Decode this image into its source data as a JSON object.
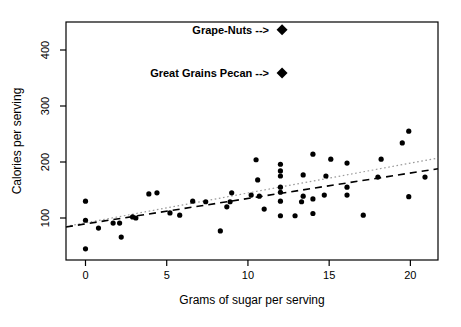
{
  "figure": {
    "background": "#ffffff",
    "frame_color": "#000000"
  },
  "chart_data": {
    "type": "scatter",
    "title": "",
    "xlabel": "Grams of sugar per serving",
    "ylabel": "Calories per serving",
    "xlim": [
      -1.2,
      21.7
    ],
    "ylim": [
      25,
      450
    ],
    "x_ticks": [
      0,
      5,
      10,
      15,
      20
    ],
    "y_ticks": [
      100,
      200,
      300,
      400
    ],
    "grid": false,
    "legend": "none",
    "point_color": "#000000",
    "points": [
      [
        0,
        130
      ],
      [
        0,
        96
      ],
      [
        0,
        45
      ],
      [
        0.8,
        82
      ],
      [
        1.7,
        91
      ],
      [
        2.1,
        91
      ],
      [
        2.2,
        66
      ],
      [
        2.9,
        102
      ],
      [
        3.1,
        100
      ],
      [
        3.9,
        143
      ],
      [
        4.4,
        145
      ],
      [
        5.2,
        109
      ],
      [
        5.8,
        105
      ],
      [
        6.6,
        130
      ],
      [
        7.4,
        129
      ],
      [
        8.3,
        77
      ],
      [
        8.7,
        120
      ],
      [
        8.9,
        129
      ],
      [
        9,
        145
      ],
      [
        10.2,
        141
      ],
      [
        10.5,
        204
      ],
      [
        10.6,
        168
      ],
      [
        10.7,
        139
      ],
      [
        11,
        116
      ],
      [
        12,
        196
      ],
      [
        12,
        184
      ],
      [
        12,
        175
      ],
      [
        12,
        155
      ],
      [
        12,
        146
      ],
      [
        12,
        130
      ],
      [
        12,
        104
      ],
      [
        12.9,
        104
      ],
      [
        13.3,
        129
      ],
      [
        13.4,
        139
      ],
      [
        13.4,
        177
      ],
      [
        14,
        214
      ],
      [
        14,
        134
      ],
      [
        14,
        108
      ],
      [
        14.7,
        141
      ],
      [
        14.8,
        175
      ],
      [
        15.1,
        205
      ],
      [
        16.1,
        198
      ],
      [
        16.1,
        155
      ],
      [
        16.1,
        141
      ],
      [
        17.1,
        105
      ],
      [
        18,
        173
      ],
      [
        18.2,
        205
      ],
      [
        19.5,
        234
      ],
      [
        19.9,
        255
      ],
      [
        19.9,
        138
      ],
      [
        20.9,
        173
      ]
    ],
    "highlight_points": [
      {
        "label": "Grape-Nuts -->",
        "x": 12.1,
        "y": 436,
        "marker": "diamond"
      },
      {
        "label": "Great Grains Pecan -->",
        "x": 12.1,
        "y": 359,
        "marker": "diamond"
      }
    ],
    "trend_lines": [
      {
        "name": "dotted-trend",
        "style": "dotted",
        "color": "#9a9a9a",
        "x1": -1.2,
        "y1": 85,
        "x2": 21.7,
        "y2": 207
      },
      {
        "name": "dashed-trend",
        "style": "dashed",
        "color": "#000000",
        "x1": -1.2,
        "y1": 84,
        "x2": 21.7,
        "y2": 188
      }
    ]
  }
}
